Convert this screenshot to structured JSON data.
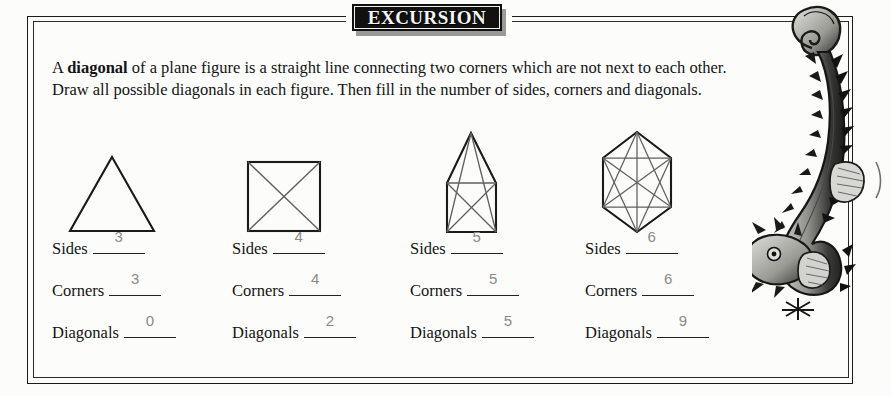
{
  "banner": {
    "title": "EXCURSION"
  },
  "paragraph": {
    "before_bold": "A ",
    "bold": "diagonal",
    "after_bold": " of a plane figure is a straight line connecting two corners which are not next to each other. Draw all possible diagonals in each figure. Then fill in the number of sides, corners and diagonals."
  },
  "labels": {
    "sides": "Sides",
    "corners": "Corners",
    "diagonals": "Diagonals"
  },
  "figures": [
    {
      "name": "triangle",
      "sides": "3",
      "corners": "3",
      "diagonals": "0"
    },
    {
      "name": "square",
      "sides": "4",
      "corners": "4",
      "diagonals": "2"
    },
    {
      "name": "pentagon",
      "sides": "5",
      "corners": "5",
      "diagonals": "5"
    },
    {
      "name": "hexagon",
      "sides": "6",
      "corners": "6",
      "diagonals": "9"
    }
  ],
  "illustration": {
    "name": "seahorse"
  },
  "colors": {
    "ink": "#141414",
    "answer_ink": "#8a8a8a",
    "banner_bg": "#111111",
    "banner_text": "#f4f4f2",
    "paper": "#fcfcfa"
  }
}
